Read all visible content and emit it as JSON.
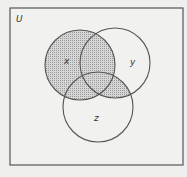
{
  "diagram": {
    "type": "venn",
    "universe_label": "U",
    "sets": [
      {
        "name": "x",
        "label": "x"
      },
      {
        "name": "y",
        "label": "y"
      },
      {
        "name": "z",
        "label": "z"
      }
    ],
    "shaded_regions": [
      "x",
      "y∩z"
    ],
    "colors": {
      "background": "#efefed",
      "stroke": "#555555",
      "shade": "#bdbdbd"
    }
  }
}
